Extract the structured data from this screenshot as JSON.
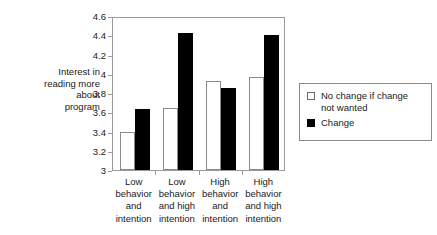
{
  "chart_data": {
    "type": "bar",
    "title": "",
    "xlabel": "",
    "ylabel": "Interest in\nreading more\nabout\nprogram",
    "ylim": [
      3,
      4.6
    ],
    "ytick_values": [
      3,
      3.2,
      3.4,
      3.6,
      3.8,
      4,
      4.2,
      4.4,
      4.6
    ],
    "ytick_labels": [
      "3",
      "3.2",
      "3.4",
      "3.6",
      "3.8",
      "4",
      "4.2",
      "4.4",
      "4.6"
    ],
    "grid": false,
    "legend_position": "right",
    "categories": [
      "Low\nbehavior\nand\nintention",
      "Low\nbehavior\nand high\nintention",
      "High\nbehavior\nand\nintention",
      "High\nbehavior\nand high\nintention"
    ],
    "series": [
      {
        "name": "No change if change\nnot wanted",
        "color": "#ffffff",
        "edge_color": "#8a8a8a",
        "values": [
          3.4,
          3.64,
          3.92,
          3.97
        ]
      },
      {
        "name": "Change",
        "color": "#000000",
        "edge_color": "#000000",
        "values": [
          3.63,
          4.42,
          3.85,
          4.4
        ]
      }
    ]
  },
  "legend": {
    "items": [
      {
        "label": "No change if change\nnot wanted",
        "swatch": "white-square"
      },
      {
        "label": "Change",
        "swatch": "black-square"
      }
    ]
  },
  "colors": {
    "axis": "#9a9a9a",
    "frame": "#9a9a9a",
    "text": "#1a1a1a",
    "series_no_change": "#ffffff",
    "series_change": "#000000"
  }
}
